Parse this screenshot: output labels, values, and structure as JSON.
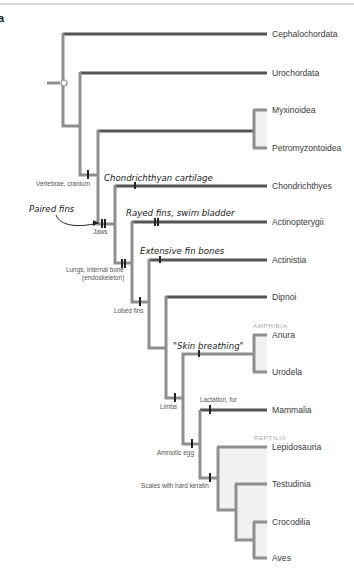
{
  "figure": {
    "panel_label": "a",
    "type": "cladogram",
    "colors": {
      "dark_branch": "#555555",
      "light_branch": "#8f8f8f",
      "tick": "#222222",
      "clade_shade": "#f1f1f1",
      "group_label": "#a9a9a9"
    }
  },
  "taxa": [
    {
      "name": "Cephalochordata"
    },
    {
      "name": "Urochordata"
    },
    {
      "name": "Myxinoidea"
    },
    {
      "name": "Petromyzontoidea"
    },
    {
      "name": "Chondrichthyes"
    },
    {
      "name": "Actinopterygii"
    },
    {
      "name": "Actinistia"
    },
    {
      "name": "Dipnoi"
    },
    {
      "name": "Anura"
    },
    {
      "name": "Urodela"
    },
    {
      "name": "Mammalia"
    },
    {
      "name": "Lepidosauria"
    },
    {
      "name": "Testudinia"
    },
    {
      "name": "Crocodilia"
    },
    {
      "name": "Aves"
    }
  ],
  "groups": {
    "amphibia": "AMPHIBIA",
    "reptilia": "REPTILIA"
  },
  "traits": {
    "vertebrae": "Vertebrae, cranium",
    "jaws": "Jaws",
    "lungs_1": "Lungs, internal bone",
    "lungs_2": "(endoskeleton)",
    "lobed_fins": "Lobed fins",
    "limbs": "Limbs",
    "amniotic_egg": "Amniotic egg",
    "lactation": "Lactation, fur",
    "scales": "Scales with hard keratin"
  },
  "annotations": {
    "paired_fins": "Paired fins",
    "chondrichthyan_cartilage": "Chondrichthyan cartilage",
    "rayed_fins": "Rayed fins, swim bladder",
    "extensive_fin_bones": "Extensive fin bones",
    "skin_breathing": "\"Skin breathing\""
  }
}
